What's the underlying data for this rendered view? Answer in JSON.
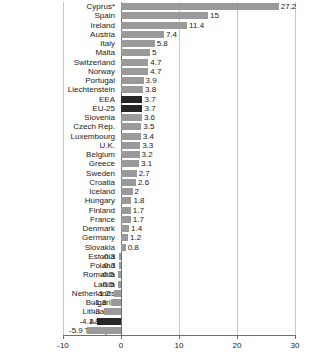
{
  "chart_data": {
    "type": "bar",
    "orientation": "horizontal",
    "title": "",
    "subtitle": "",
    "xlabel": "",
    "ylabel": "",
    "xlim": [
      -10,
      30
    ],
    "xticks": [
      -10,
      0,
      10,
      20,
      30
    ],
    "xtick_labels": [
      "-10",
      "0",
      "10",
      "20",
      "30"
    ],
    "grid": true,
    "grid_axis": "x",
    "legend": "none",
    "colors": {
      "bar_default": "#9a9a9a",
      "bar_highlight": "#262626",
      "gridline": "#c8c8c8",
      "axis": "#6e6e6e",
      "text": "#1a1a1a",
      "background": "#ffffff"
    },
    "categories": [
      "Cyprus*",
      "Spain",
      "Ireland",
      "Austria",
      "Italy",
      "Malta",
      "Switzerland",
      "Norway",
      "Portugal",
      "Liechtenstein",
      "EEA",
      "EU-25",
      "Slovenia",
      "Czech Rep.",
      "Luxembourg",
      "U.K.",
      "Belgium",
      "Greece",
      "Sweden",
      "Croatia",
      "Iceland",
      "Hungary",
      "Finland",
      "France",
      "Denmark",
      "Germany",
      "Slovakia",
      "Estonia",
      "Poland",
      "Romania",
      "Latvia",
      "Netherlands",
      "Bulgaria",
      "Lithuania",
      "A&C***",
      "Turkey**"
    ],
    "values": [
      27.2,
      15,
      11.4,
      7.4,
      5.8,
      5,
      4.7,
      4.7,
      3.9,
      3.8,
      3.7,
      3.7,
      3.6,
      3.5,
      3.4,
      3.3,
      3.2,
      3.1,
      2.7,
      2.6,
      2,
      1.8,
      1.7,
      1.7,
      1.4,
      1.2,
      0.8,
      -0.3,
      -0.3,
      -0.5,
      -0.5,
      -1.2,
      -1.8,
      -3,
      -4.1,
      -5.9
    ],
    "value_labels": [
      "27.2",
      "15",
      "11.4",
      "7.4",
      "5.8",
      "5",
      "4.7",
      "4.7",
      "3.9",
      "3.8",
      "3.7",
      "3.7",
      "3.6",
      "3.5",
      "3.4",
      "3.3",
      "3.2",
      "3.1",
      "2.7",
      "2.6",
      "2",
      "1.8",
      "1.7",
      "1.7",
      "1.4",
      "1.2",
      "0.8",
      "-0.3",
      "-0.3",
      "-0.5",
      "-0.5",
      "-1.2",
      "-1.8",
      "-3",
      "-4.1",
      "-5.9"
    ],
    "highlighted": [
      "EEA",
      "EU-25",
      "A&C***"
    ]
  }
}
